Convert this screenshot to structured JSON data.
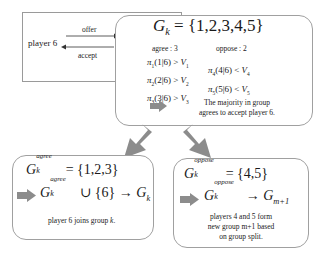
{
  "left_panel": {
    "player_label": "player 6",
    "offer_label": "offer",
    "accept_label": "accept"
  },
  "top_box": {
    "group_symbol": "G",
    "group_sub": "k",
    "group_set": " = {1,2,3,4,5}",
    "agree_header": "agree : 3",
    "oppose_header": "oppose : 2",
    "agree_conditions": [
      {
        "pi": "π",
        "pi_sub": "1",
        "cond": "(1|6) > ",
        "v": "V",
        "v_sub": "1"
      },
      {
        "pi": "π",
        "pi_sub": "2",
        "cond": "(2|6) > ",
        "v": "V",
        "v_sub": "2"
      },
      {
        "pi": "π",
        "pi_sub": "3",
        "cond": "(3|6) > ",
        "v": "V",
        "v_sub": "3"
      }
    ],
    "oppose_conditions": [
      {
        "pi": "π",
        "pi_sub": "4",
        "cond": "(4|6) < ",
        "v": "V",
        "v_sub": "4"
      },
      {
        "pi": "π",
        "pi_sub": "5",
        "cond": "(5|6) < ",
        "v": "V",
        "v_sub": "5"
      }
    ],
    "conclusion_line1": "The majority in group",
    "conclusion_line2": "agrees to accept player 6."
  },
  "left_box": {
    "symbol": "G",
    "sub": "k",
    "sup": "agree",
    "set": " = {1,2,3}",
    "union_text": " ∪ {6} → ",
    "target": "G",
    "target_sub": "k",
    "caption": "player 6 joins group ",
    "caption_var": "k",
    "caption_end": "."
  },
  "right_box": {
    "symbol": "G",
    "sub": "k",
    "sup": "oppose",
    "set": " = {4,5}",
    "arrow_text": " → ",
    "target": "G",
    "target_sub": "m+1",
    "caption_line1": "players 4 and 5 form",
    "caption_line2": "new group m+1 based",
    "caption_line3": "on group split."
  },
  "colors": {
    "arrow": "#8c8c8c",
    "border": "#a0a0a0",
    "text": "#1a1a1a"
  }
}
